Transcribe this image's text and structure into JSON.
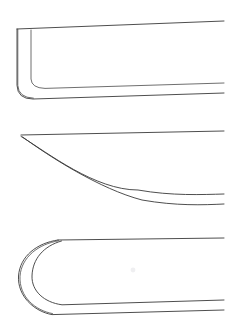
{
  "canvas": {
    "width": 240,
    "height": 326,
    "background_color": "#ffffff",
    "ink_color": "#3a3a3a",
    "ink_color_soft": "#4a4a4a",
    "medium": "pencil line drawing on white paper"
  },
  "sheet": {
    "title": "Hull end profile line drawings",
    "figure_count": 3,
    "orientation": "stacked vertically, all ends open to the right"
  },
  "figures": [
    {
      "id": "figure-1",
      "label": "square-forefoot profile",
      "description": "Straight stem with vertical leading edge and a tight rounded corner joining a near-horizontal keel line; a second inner line parallels the stem and turn.",
      "end_shape": "square / vertical stem with radiused corner",
      "line_count": 4,
      "bounds": {
        "x": 17,
        "y": 20,
        "width": 208,
        "height": 85
      },
      "geometry": {
        "sheer_line": {
          "start": [
            17,
            29
          ],
          "end": [
            224,
            21
          ]
        },
        "outer_stem_vertical": {
          "x": 17,
          "top": 29,
          "bottom": 90
        },
        "inner_stem_vertical": {
          "x": 31,
          "top": 30,
          "bottom": 78
        },
        "outer_corner_radius": 14,
        "inner_corner_radius": 10,
        "inner_keel_line": {
          "start": [
            45,
            88
          ],
          "end": [
            224,
            83
          ]
        },
        "outer_keel_line": {
          "start": [
            33,
            99
          ],
          "end": [
            224,
            93
          ]
        }
      }
    },
    {
      "id": "figure-2",
      "label": "fine raking cutaway profile",
      "description": "Sharp point at the forward end where two long concave curves sweep down and aft to the right; a straight near-horizontal line runs aft from the same point.",
      "end_shape": "pointed / sharply raked cutaway",
      "line_count": 3,
      "bounds": {
        "x": 21,
        "y": 131,
        "width": 204,
        "height": 75
      },
      "geometry": {
        "apex_point": [
          21,
          135
        ],
        "sheer_line": {
          "start": [
            21,
            135
          ],
          "end": [
            224,
            131
          ]
        },
        "inner_curve": {
          "start": [
            21,
            136
          ],
          "control": [
            95,
            190
          ],
          "end": [
            224,
            194
          ]
        },
        "outer_curve": {
          "start": [
            22,
            138
          ],
          "control": [
            100,
            202
          ],
          "end": [
            224,
            204
          ]
        }
      }
    },
    {
      "id": "figure-3",
      "label": "round bluff-bow profile",
      "description": "Full semicircular rounded end; two concentric arcs sweep from the upper line around the forward face to the lower line, giving a bulbous bow form.",
      "end_shape": "round / bluff semicircular",
      "line_count": 4,
      "bounds": {
        "x": 20,
        "y": 238,
        "width": 205,
        "height": 80
      },
      "geometry": {
        "arc_junction_top": [
          58,
          240
        ],
        "sheer_line": {
          "start": [
            58,
            240
          ],
          "end": [
            224,
            238
          ]
        },
        "outer_arc": {
          "start": [
            58,
            240
          ],
          "control_a": [
            18,
            252
          ],
          "control_b": [
            18,
            300
          ],
          "end": [
            58,
            315
          ]
        },
        "inner_arc": {
          "start": [
            60,
            241
          ],
          "control_a": [
            32,
            256
          ],
          "control_b": [
            32,
            295
          ],
          "end": [
            72,
            305
          ]
        },
        "inner_keel_line": {
          "start": [
            72,
            305
          ],
          "end": [
            224,
            300
          ]
        },
        "outer_keel_line": {
          "start": [
            58,
            315
          ],
          "end": [
            224,
            310
          ]
        }
      }
    }
  ],
  "artifacts": [
    {
      "id": "smudge-1",
      "kind": "paper-smudge",
      "x": 133,
      "y": 270,
      "radius": 2.4
    }
  ]
}
